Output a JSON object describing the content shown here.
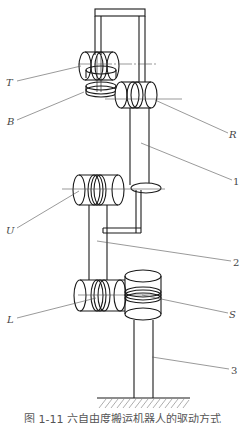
{
  "diagram": {
    "type": "six-axis robot joint drive schematic",
    "joint_labels": {
      "T": "T",
      "B": "B",
      "R": "R",
      "U": "U",
      "L": "L",
      "S": "S"
    },
    "part_labels": {
      "p1": "1",
      "p2": "2",
      "p3": "3"
    },
    "caption": "图 1-11   六自由度搬运机器人的驱动方式",
    "colors": {
      "line": "#1a1a1a",
      "leader": "#555555",
      "label": "#444444",
      "background": "#ffffff"
    }
  }
}
